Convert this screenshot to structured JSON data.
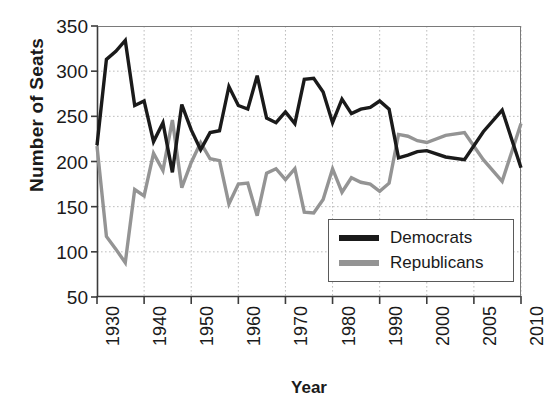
{
  "chart_data": {
    "type": "line",
    "title": "",
    "xlabel": "Year",
    "ylabel": "Number of Seats",
    "xlim": [
      1930,
      2010
    ],
    "ylim": [
      50,
      350
    ],
    "yticks": [
      350,
      300,
      250,
      200,
      150,
      100,
      50
    ],
    "xticks": [
      1930,
      1940,
      1950,
      1960,
      1970,
      1980,
      1990,
      2000,
      2005,
      2010
    ],
    "xtick_labels": [
      "1930",
      "1940",
      "1950",
      "1960",
      "1970",
      "1980",
      "1990",
      "2000",
      "2005",
      "2010"
    ],
    "xaxis_note": "tick spacing is uniform on screen although 1990-2000-2005-2010 are unequal year intervals",
    "grid": true,
    "grid_style": "dotted",
    "legend_position": "lower-right",
    "x": [
      1930,
      1932,
      1934,
      1936,
      1938,
      1940,
      1942,
      1944,
      1946,
      1948,
      1950,
      1952,
      1954,
      1956,
      1958,
      1960,
      1962,
      1964,
      1966,
      1968,
      1970,
      1972,
      1974,
      1976,
      1978,
      1980,
      1982,
      1984,
      1986,
      1988,
      1990,
      1992,
      1994,
      1996,
      1998,
      2000,
      2002,
      2004,
      2006,
      2008,
      2010
    ],
    "series": [
      {
        "name": "Democrats",
        "color": "#1a1a1a",
        "values": [
          218,
          313,
          322,
          334,
          262,
          267,
          222,
          243,
          188,
          263,
          235,
          213,
          232,
          234,
          283,
          262,
          258,
          295,
          248,
          243,
          255,
          242,
          291,
          292,
          277,
          243,
          269,
          253,
          258,
          260,
          267,
          258,
          204,
          207,
          211,
          212,
          205,
          202,
          233,
          257,
          193
        ]
      },
      {
        "name": "Republicans",
        "color": "#949494",
        "values": [
          217,
          117,
          103,
          88,
          169,
          162,
          209,
          190,
          246,
          171,
          199,
          221,
          203,
          201,
          153,
          175,
          176,
          140,
          187,
          192,
          180,
          192,
          144,
          143,
          158,
          192,
          166,
          182,
          177,
          175,
          167,
          176,
          230,
          228,
          223,
          221,
          229,
          232,
          202,
          178,
          242
        ]
      }
    ]
  },
  "legend": {
    "entries": [
      {
        "label": "Democrats",
        "color": "#1a1a1a"
      },
      {
        "label": "Republicans",
        "color": "#949494"
      }
    ]
  }
}
